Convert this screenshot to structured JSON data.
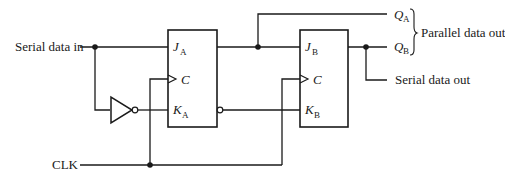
{
  "diagram": {
    "type": "2-bit serial-in / parallel-out shift register (J-K flip-flops)",
    "inputs": {
      "serial_in": "Serial data in",
      "clock": "CLK"
    },
    "outputs": {
      "qa": {
        "letter": "Q",
        "sub": "A"
      },
      "qb": {
        "letter": "Q",
        "sub": "B"
      },
      "parallel_label": "Parallel data out",
      "serial_out": "Serial data out"
    },
    "flipflops": [
      {
        "name": "A",
        "j": {
          "letter": "J",
          "sub": "A"
        },
        "c": "C",
        "k": {
          "letter": "K",
          "sub": "A"
        }
      },
      {
        "name": "B",
        "j": {
          "letter": "J",
          "sub": "B"
        },
        "c": "C",
        "k": {
          "letter": "K",
          "sub": "B"
        }
      }
    ],
    "colors": {
      "ink": "#1a1a1a",
      "background": "#ffffff"
    }
  }
}
